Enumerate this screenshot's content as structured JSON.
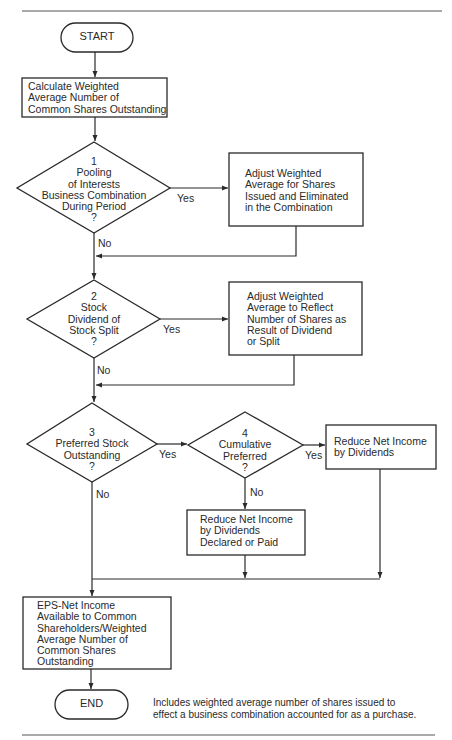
{
  "flowchart": {
    "start": {
      "label": "START"
    },
    "end": {
      "label": "END"
    },
    "steps": [
      {
        "id": "calc",
        "type": "process",
        "lines": [
          "Calculate Weighted",
          "Average Number of",
          "Common Shares Outstanding"
        ]
      },
      {
        "id": "d1",
        "type": "decision",
        "number": "1",
        "lines": [
          "Pooling",
          "of Interests",
          "Business Combination",
          "During Period",
          "?"
        ]
      },
      {
        "id": "adj1",
        "type": "process",
        "lines": [
          "Adjust Weighted",
          "Average for Shares",
          "Issued and Eliminated",
          "in the Combination"
        ]
      },
      {
        "id": "d2",
        "type": "decision",
        "number": "2",
        "lines": [
          "Stock",
          "Dividend of",
          "Stock Split",
          "?"
        ]
      },
      {
        "id": "adj2",
        "type": "process",
        "lines": [
          "Adjust Weighted",
          "Average to Reflect",
          "Number of Shares as",
          "Result of Dividend",
          "or Split"
        ]
      },
      {
        "id": "d3",
        "type": "decision",
        "number": "3",
        "lines": [
          "Preferred Stock",
          "Outstanding",
          "?"
        ]
      },
      {
        "id": "d4",
        "type": "decision",
        "number": "4",
        "lines": [
          "Cumulative",
          "Preferred",
          "?"
        ]
      },
      {
        "id": "red1",
        "type": "process",
        "lines": [
          "Reduce Net Income",
          "by Dividends"
        ]
      },
      {
        "id": "red2",
        "type": "process",
        "lines": [
          "Reduce Net Income",
          "by Dividends",
          "Declared or Paid"
        ]
      },
      {
        "id": "eps",
        "type": "process",
        "lines": [
          "EPS-Net Income",
          "Available to Common",
          "Shareholders/Weighted",
          "Average Number of",
          "Common Shares",
          "Outstanding"
        ]
      }
    ],
    "branch_labels": {
      "yes": "Yes",
      "no": "No"
    },
    "footnote": {
      "lines": [
        "Includes weighted average number of shares issued to",
        "effect a business combination accounted for as a purchase."
      ]
    }
  }
}
